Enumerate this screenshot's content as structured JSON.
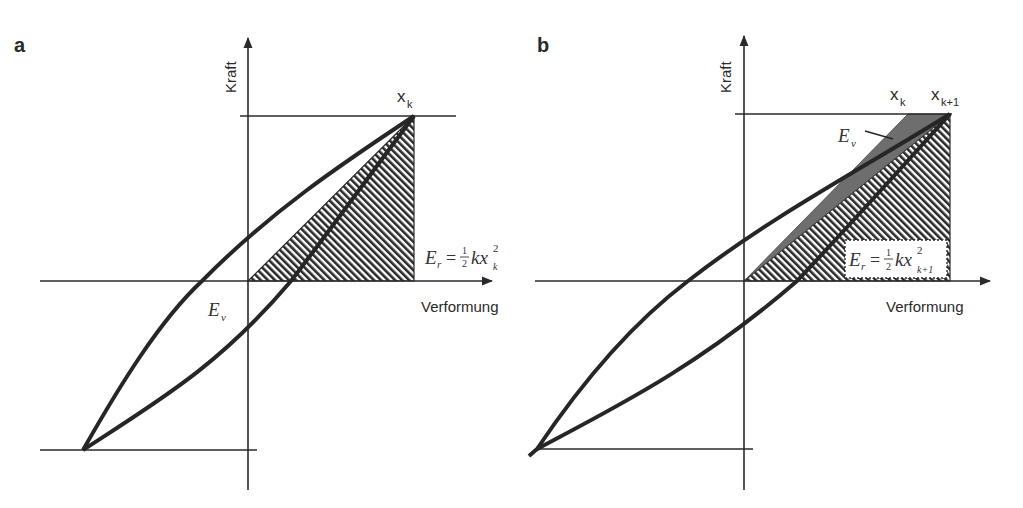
{
  "figure": {
    "panels": [
      {
        "id": "a",
        "label": "a",
        "y_axis_label": "Kraft",
        "x_axis_label": "Verformung",
        "peak_label": "x",
        "peak_label_sub": "k",
        "energy_loss_label": "E",
        "energy_loss_sub": "v",
        "energy_return": {
          "lhs": "E",
          "lhs_sub": "r",
          "eq": "=",
          "num": "1",
          "den": "2",
          "kx": "kx",
          "sup": "2",
          "sub": "k"
        }
      },
      {
        "id": "b",
        "label": "b",
        "y_axis_label": "Kraft",
        "x_axis_label": "Verformung",
        "peak_label_k": "x",
        "peak_label_k_sub": "k",
        "peak_label_k1": "x",
        "peak_label_k1_sub": "k+1",
        "energy_loss_label": "E",
        "energy_loss_sub": "v",
        "energy_return": {
          "lhs": "E",
          "lhs_sub": "r",
          "eq": "=",
          "num": "1",
          "den": "2",
          "kx": "kx",
          "sup": "2",
          "sub": "k+1"
        }
      }
    ],
    "colors": {
      "line": "#262626",
      "hatch": "#2a2a2a",
      "loss_fill": "#6e6e6e",
      "background": "#ffffff"
    }
  }
}
